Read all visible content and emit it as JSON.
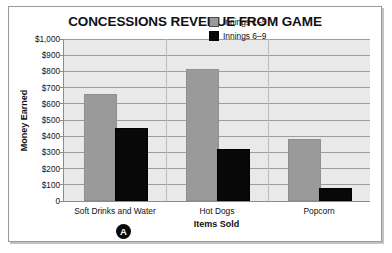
{
  "chart_data": {
    "type": "bar",
    "title": "CONCESSIONS REVENUE FROM GAME",
    "xlabel": "Items Sold",
    "ylabel": "Money Earned",
    "categories": [
      "Soft Drinks and Water",
      "Hot Dogs",
      "Popcorn"
    ],
    "series": [
      {
        "name": "Innings 1–5",
        "color": "#9a9a9a",
        "values": [
          650,
          800,
          370
        ]
      },
      {
        "name": "Innings 6–9",
        "color": "#080808",
        "values": [
          440,
          310,
          70
        ]
      }
    ],
    "ylim": [
      0,
      1000
    ],
    "yticks": [
      0,
      100,
      200,
      300,
      400,
      500,
      600,
      700,
      800,
      900,
      1000
    ],
    "ytick_labels": [
      "0",
      "$100",
      "$200",
      "$300",
      "$400",
      "$500",
      "$600",
      "$700",
      "$800",
      "$900",
      "$1,000"
    ],
    "grid": true,
    "legend_position": "top-right",
    "plot_background": "#e9e9e9",
    "annotations": [
      {
        "name": "answer-marker",
        "label": "A",
        "shape": "filled-circle",
        "color": "#0a0a0a",
        "text_color": "#ffffff"
      }
    ]
  }
}
